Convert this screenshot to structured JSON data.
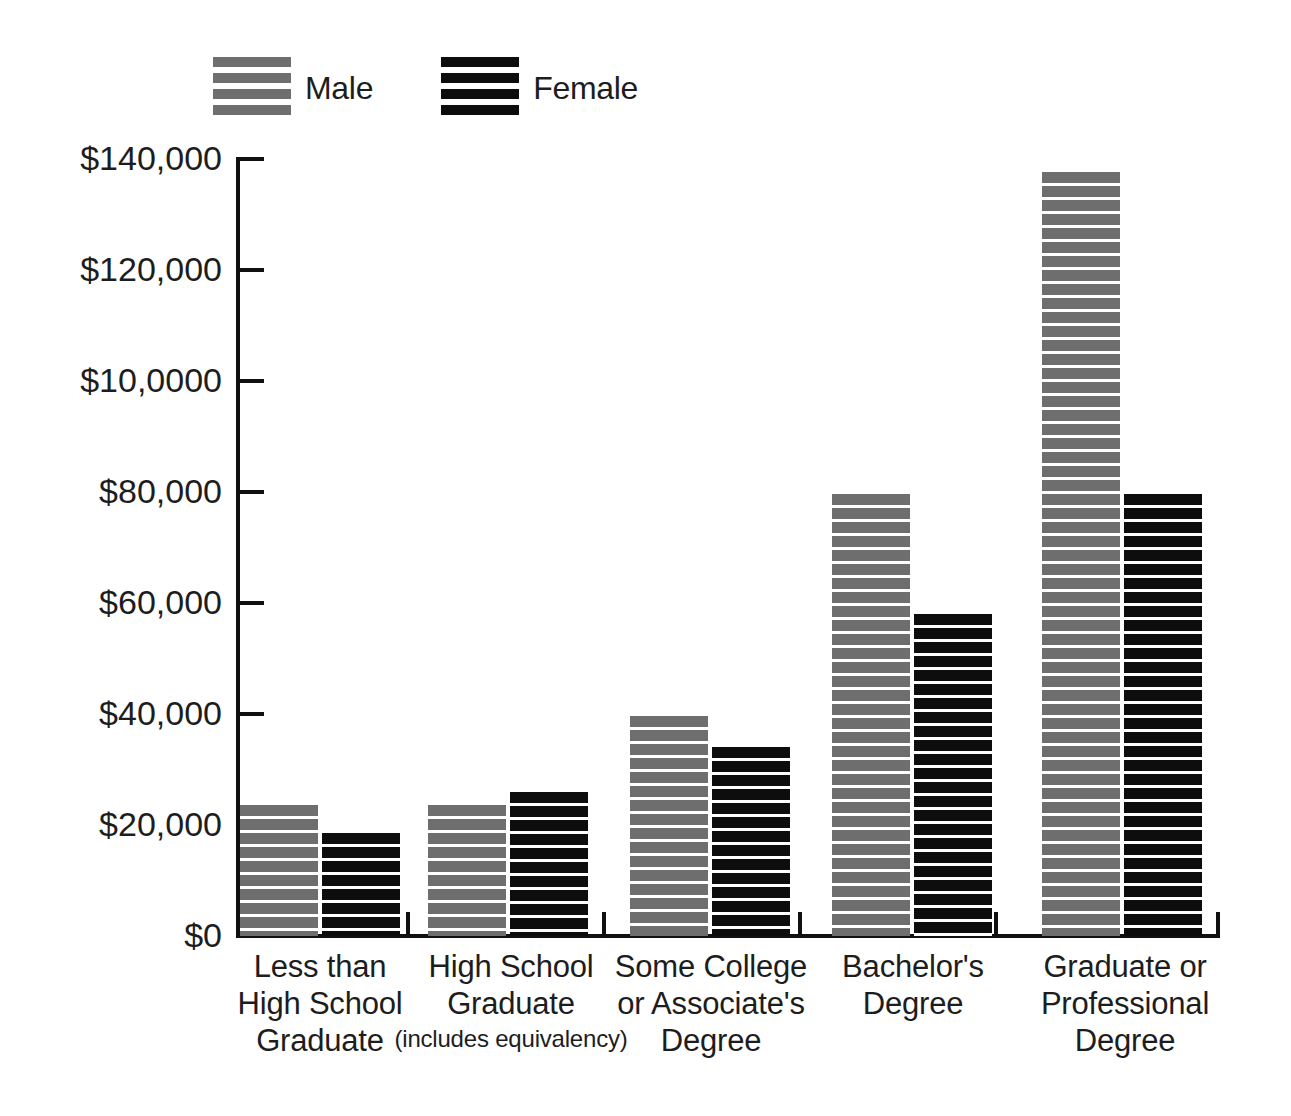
{
  "chart_data": {
    "type": "bar",
    "title": "",
    "subtitle": "",
    "xlabel": "",
    "ylabel": "",
    "grid": false,
    "legend_position": "top-left",
    "categories": [
      "Less than High School Graduate",
      "High School Graduate (includes equivalency)",
      "Some College or Associate's Degree",
      "Bachelor's Degree",
      "Graduate or Professional Degree"
    ],
    "series": [
      {
        "name": "Male",
        "color": "#6e6e6e",
        "values": [
          23500,
          23500,
          39500,
          79500,
          137500
        ]
      },
      {
        "name": "Female",
        "color": "#0d0d0d",
        "values": [
          18500,
          26000,
          34000,
          58000,
          79500
        ]
      }
    ],
    "ylim": [
      0,
      140000
    ],
    "ytick_values": [
      0,
      20000,
      40000,
      60000,
      80000,
      100000,
      120000,
      140000
    ],
    "ytick_labels": [
      "$0",
      "$20,000",
      "$40,000",
      "$60,000",
      "$80,000",
      "$10,0000",
      "$120,000",
      "$140,000"
    ]
  },
  "legend": {
    "entries": [
      {
        "label": "Male",
        "swatch": "stripe-gray-swatch"
      },
      {
        "label": "Female",
        "swatch": "stripe-black-swatch"
      }
    ]
  },
  "axis": {
    "y_labels": [
      "$140,000",
      "$120,000",
      "$10,0000",
      "$80,000",
      "$60,000",
      "$40,000",
      "$20,000",
      "$0"
    ]
  },
  "categories": [
    {
      "line1": "Less than",
      "line2": "High School",
      "line3": "Graduate",
      "sub": ""
    },
    {
      "line1": "High School",
      "line2": "Graduate",
      "line3": "",
      "sub": "(includes equivalency)"
    },
    {
      "line1": "Some College",
      "line2": "or Associate's",
      "line3": "Degree",
      "sub": ""
    },
    {
      "line1": "Bachelor's",
      "line2": "Degree",
      "line3": "",
      "sub": ""
    },
    {
      "line1": "Graduate or",
      "line2": "Professional",
      "line3": "Degree",
      "sub": ""
    }
  ]
}
